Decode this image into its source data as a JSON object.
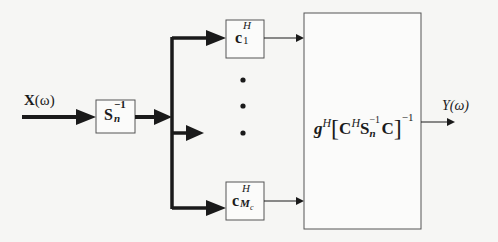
{
  "diagram": {
    "type": "block-diagram",
    "input": {
      "label_main": "X",
      "label_arg": "(ω)"
    },
    "whitening_block": {
      "main": "S",
      "sub": "n",
      "sup": "−1"
    },
    "branch_top": {
      "main": "c",
      "sub": "1",
      "sup": "H"
    },
    "branch_bottom": {
      "main": "c",
      "sub": "M",
      "subsub": "c",
      "sup": "H"
    },
    "ellipsis": "⋮",
    "combiner_block": {
      "g": "g",
      "g_sup": "H",
      "lbracket": "[",
      "C1": "C",
      "C1_sup": "H",
      "S": "S",
      "S_sub": "n",
      "S_sup": "−1",
      "C2": "C",
      "rbracket": "]",
      "outer_sup": "−1"
    },
    "output": {
      "label": "Y(ω)"
    },
    "colors": {
      "line": "#1a1a1a",
      "box_border": "#555555",
      "background": "#f6f6f4"
    }
  }
}
